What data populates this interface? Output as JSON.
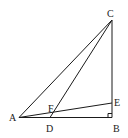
{
  "diagram": {
    "type": "geometry",
    "points": {
      "A": {
        "label": "A",
        "x": 19,
        "y": 117
      },
      "B": {
        "label": "B",
        "x": 112,
        "y": 118
      },
      "C": {
        "label": "C",
        "x": 112,
        "y": 20
      },
      "D": {
        "label": "D",
        "x": 50,
        "y": 118
      },
      "E": {
        "label": "E",
        "x": 112,
        "y": 103
      },
      "F": {
        "label": "F",
        "x": 54,
        "y": 110
      }
    },
    "segments": [
      "AB",
      "BC",
      "CA",
      "CD",
      "AE"
    ],
    "right_angle_at": "B"
  }
}
